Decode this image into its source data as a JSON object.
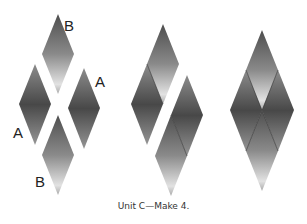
{
  "figure": {
    "caption": "Unit C—Make 4.",
    "colors": {
      "background": "#ffffff",
      "piece_a_top": "#8c8c8c",
      "piece_a_mid": "#484848",
      "piece_a_bottom": "#959595",
      "piece_b_top": "#4e4e4e",
      "piece_b_mid": "#8a8a8a",
      "piece_b_bottom": "#e2e2e2",
      "seam": "#3a3a3a",
      "label_text": "#222222"
    },
    "step1": {
      "description": "Separated diamond pieces",
      "labels": [
        {
          "text": "B",
          "role": "top-piece-label"
        },
        {
          "text": "A",
          "role": "right-piece-label"
        },
        {
          "text": "A",
          "role": "left-piece-label"
        },
        {
          "text": "B",
          "role": "bottom-piece-label"
        }
      ]
    },
    "step2": {
      "description": "Pieces joined into two halves"
    },
    "step3": {
      "description": "Completed unit of four diamonds"
    }
  }
}
